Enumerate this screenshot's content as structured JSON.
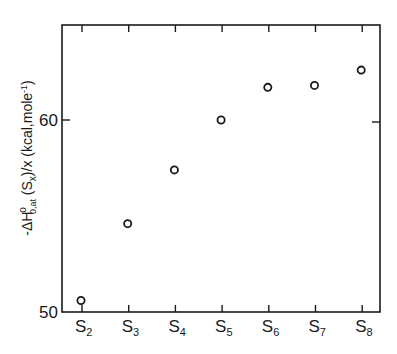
{
  "chart_data": {
    "type": "scatter",
    "title": "",
    "xlabel": "",
    "ylabel": "-ΔH°₀,at (Sx)/x (kcal,mole⁻¹)",
    "ylabel_parts": {
      "prefix": "-ΔH",
      "sup": "o",
      "sub": "0,at",
      "middle": " (S",
      "middle_sub": "x",
      "suffix": ")/x (kcal,mole",
      "suffix_sup": "-1",
      "end": ")"
    },
    "categories": [
      "S2",
      "S3",
      "S4",
      "S5",
      "S6",
      "S7",
      "S8"
    ],
    "category_labels": [
      {
        "base": "S",
        "sub": "2"
      },
      {
        "base": "S",
        "sub": "3"
      },
      {
        "base": "S",
        "sub": "4"
      },
      {
        "base": "S",
        "sub": "5"
      },
      {
        "base": "S",
        "sub": "6"
      },
      {
        "base": "S",
        "sub": "7"
      },
      {
        "base": "S",
        "sub": "8"
      }
    ],
    "series": [
      {
        "name": "",
        "marker": "open-circle",
        "values": [
          50.6,
          54.6,
          57.4,
          60.0,
          61.7,
          61.8,
          62.6
        ]
      }
    ],
    "ylim": [
      50,
      65
    ],
    "yticks": [
      50,
      60
    ],
    "ytick_labels": [
      "50",
      "60"
    ],
    "grid": false,
    "legend": null
  }
}
